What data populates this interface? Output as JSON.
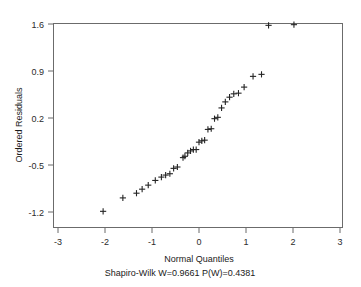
{
  "chart_data": {
    "type": "scatter",
    "title": "",
    "xlabel": "Normal Quantiles",
    "ylabel": "Ordered Residuals",
    "subtitle": "Shapiro-Wilk W=0.9661 P(W)=0.4381",
    "xlim": [
      -3.3,
      3.3
    ],
    "ylim": [
      -1.38,
      1.78
    ],
    "xticks": [
      -3,
      -2,
      -1,
      0,
      1,
      2,
      3
    ],
    "xticklabels": [
      "-3",
      "-2",
      "-1",
      "0",
      "1",
      "2",
      "3"
    ],
    "yticks": [
      1.6,
      0.9,
      0.2,
      -0.5,
      -1.2
    ],
    "yticklabels": [
      "1.6",
      "0.9",
      "0.2",
      "-0.5",
      "-1.2"
    ],
    "grid": false,
    "legend": false,
    "marker": "plus",
    "marker_color": "#242424",
    "frame_color": "#6b6b6b",
    "series": [
      {
        "name": "Ordered Residuals vs Normal Quantiles",
        "x": [
          -2.04,
          -1.62,
          -1.33,
          -1.21,
          -1.08,
          -0.93,
          -0.8,
          -0.71,
          -0.62,
          -0.54,
          -0.46,
          -0.34,
          -0.3,
          -0.24,
          -0.18,
          -0.12,
          -0.06,
          0.0,
          0.06,
          0.12,
          0.19,
          0.26,
          0.33,
          0.4,
          0.48,
          0.56,
          0.65,
          0.74,
          0.84,
          0.96,
          1.15,
          1.33,
          1.48,
          2.02
        ],
        "y": [
          -1.19,
          -0.99,
          -0.92,
          -0.86,
          -0.8,
          -0.73,
          -0.68,
          -0.65,
          -0.63,
          -0.55,
          -0.53,
          -0.39,
          -0.37,
          -0.32,
          -0.29,
          -0.27,
          -0.27,
          -0.16,
          -0.14,
          -0.13,
          0.03,
          0.04,
          0.19,
          0.21,
          0.35,
          0.44,
          0.51,
          0.56,
          0.57,
          0.66,
          0.82,
          0.85,
          1.58,
          1.59
        ]
      }
    ]
  },
  "stats": {
    "test_name": "Shapiro-Wilk",
    "w_label": "W",
    "w_value": "0.9661",
    "p_label": "P(W)",
    "p_value": "0.4381"
  }
}
